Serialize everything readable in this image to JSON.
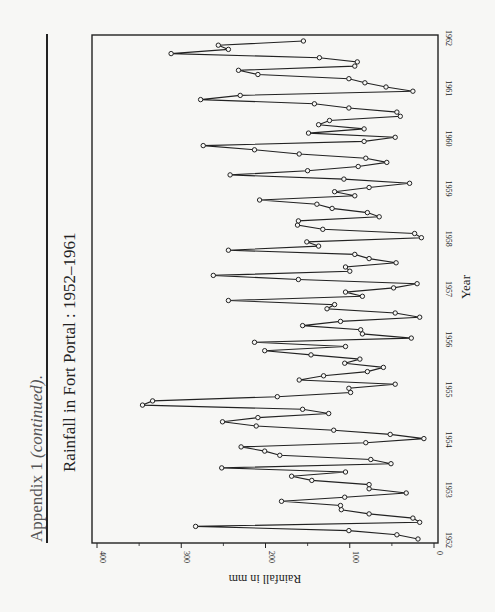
{
  "page": {
    "heading_prefix": "Appendix 1 ",
    "heading_italic": "(continued)",
    "heading_suffix": "."
  },
  "chart_data": {
    "type": "line",
    "title": "Rainfall in Fort Portal : 1952–1961",
    "xlabel": "Year",
    "ylabel": "Rainfall in mm",
    "ylim": [
      0,
      400
    ],
    "yticks": [
      0,
      100,
      200,
      300,
      400
    ],
    "xticks": [
      "1952",
      "1953",
      "1954",
      "1955",
      "1956",
      "1957",
      "1958",
      "1959",
      "1960",
      "1961",
      "1962"
    ],
    "grid": false,
    "orientation": "page rotated 90° counter-clockwise",
    "marker": "open circle",
    "frequency": "monthly",
    "series": [
      {
        "name": "Monthly rainfall (mm)",
        "values": [
          19,
          44,
          101,
          283,
          17,
          25,
          77,
          110,
          111,
          181,
          106,
          33,
          77,
          77,
          145,
          169,
          105,
          252,
          51,
          75,
          183,
          201,
          229,
          81,
          12,
          52,
          119,
          211,
          251,
          209,
          125,
          156,
          346,
          334,
          186,
          99,
          101,
          46,
          160,
          131,
          79,
          60,
          106,
          88,
          146,
          201,
          105,
          213,
          27,
          85,
          87,
          156,
          111,
          17,
          46,
          127,
          118,
          244,
          85,
          105,
          48,
          20,
          161,
          262,
          100,
          105,
          45,
          77,
          94,
          244,
          137,
          151,
          15,
          23,
          132,
          162,
          161,
          65,
          79,
          121,
          139,
          207,
          94,
          118,
          77,
          29,
          107,
          242,
          150,
          90,
          56,
          81,
          160,
          213,
          274,
          83,
          46,
          149,
          83,
          137,
          124,
          40,
          44,
          101,
          142,
          277,
          230,
          25,
          57,
          82,
          101,
          209,
          232,
          94,
          91,
          136,
          312,
          244,
          256,
          155
        ]
      }
    ]
  },
  "colors": {
    "ink": "#222222",
    "paper": "#f7f7f5"
  }
}
